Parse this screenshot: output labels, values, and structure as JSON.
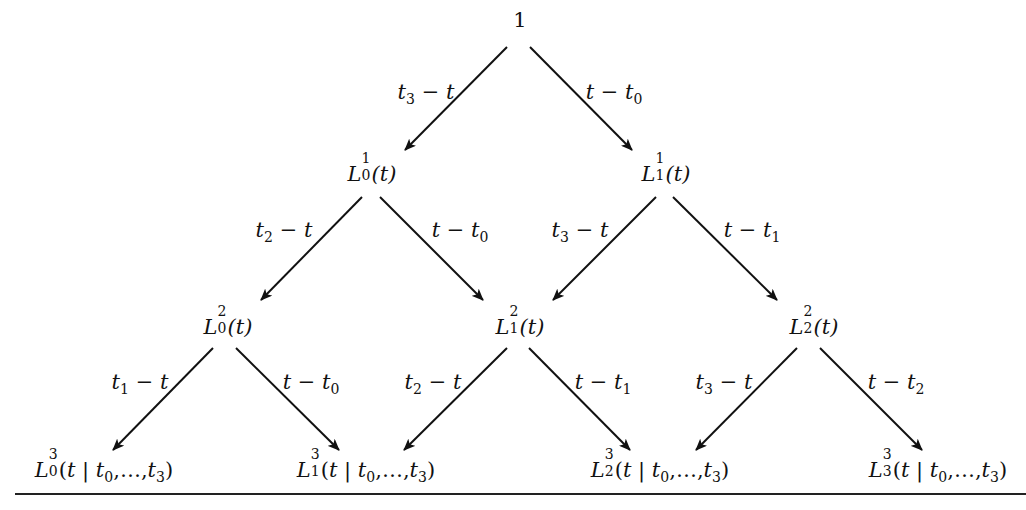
{
  "diagram": {
    "type": "tree",
    "root": {
      "id": "root",
      "label": "1",
      "x": 520,
      "y": 20
    },
    "nodes": [
      {
        "id": "L1_0",
        "base": "L",
        "sup": "1",
        "sub": "0",
        "arg": "(t)",
        "x": 372,
        "y": 172
      },
      {
        "id": "L1_1",
        "base": "L",
        "sup": "1",
        "sub": "1",
        "arg": "(t)",
        "x": 666,
        "y": 172
      },
      {
        "id": "L2_0",
        "base": "L",
        "sup": "2",
        "sub": "0",
        "arg": "(t)",
        "x": 228,
        "y": 325
      },
      {
        "id": "L2_1",
        "base": "L",
        "sup": "2",
        "sub": "1",
        "arg": "(t)",
        "x": 520,
        "y": 325
      },
      {
        "id": "L2_2",
        "base": "L",
        "sup": "2",
        "sub": "2",
        "arg": "(t)",
        "x": 814,
        "y": 325
      },
      {
        "id": "L3_0",
        "base": "L",
        "sup": "3",
        "sub": "0",
        "arg": "(t | t0,…,t3)",
        "x": 104,
        "y": 470
      },
      {
        "id": "L3_1",
        "base": "L",
        "sup": "3",
        "sub": "1",
        "arg": "(t | t0,…,t3)",
        "x": 366,
        "y": 470
      },
      {
        "id": "L3_2",
        "base": "L",
        "sup": "3",
        "sub": "2",
        "arg": "(t | t0,…,t3)",
        "x": 660,
        "y": 470
      },
      {
        "id": "L3_3",
        "base": "L",
        "sup": "3",
        "sub": "3",
        "arg": "(t | t0,…,t3)",
        "x": 938,
        "y": 470
      }
    ],
    "edges": [
      {
        "from": "root",
        "to": "L1_0",
        "label": "t3 − t",
        "x1": 507,
        "y1": 47,
        "x2": 405,
        "y2": 150,
        "lx": 426,
        "ly": 92
      },
      {
        "from": "root",
        "to": "L1_1",
        "label": "t − t0",
        "x1": 530,
        "y1": 47,
        "x2": 632,
        "y2": 150,
        "lx": 612,
        "ly": 92
      },
      {
        "from": "L1_0",
        "to": "L2_0",
        "label": "t2 − t",
        "x1": 362,
        "y1": 197,
        "x2": 261,
        "y2": 300,
        "lx": 284,
        "ly": 231
      },
      {
        "from": "L1_0",
        "to": "L2_1",
        "label": "t − t0",
        "x1": 380,
        "y1": 197,
        "x2": 483,
        "y2": 300,
        "lx": 460,
        "ly": 231
      },
      {
        "from": "L1_1",
        "to": "L2_1",
        "label": "t3 − t",
        "x1": 656,
        "y1": 197,
        "x2": 553,
        "y2": 300,
        "lx": 580,
        "ly": 231
      },
      {
        "from": "L1_1",
        "to": "L2_2",
        "label": "t − t1",
        "x1": 673,
        "y1": 197,
        "x2": 777,
        "y2": 300,
        "lx": 752,
        "ly": 231
      },
      {
        "from": "L2_0",
        "to": "L3_0",
        "label": "t1 − t",
        "x1": 213,
        "y1": 348,
        "x2": 113,
        "y2": 450,
        "lx": 140,
        "ly": 383
      },
      {
        "from": "L2_0",
        "to": "L3_1",
        "label": "t − t0",
        "x1": 236,
        "y1": 348,
        "x2": 339,
        "y2": 450,
        "lx": 311,
        "ly": 383
      },
      {
        "from": "L2_1",
        "to": "L3_1",
        "label": "t2 − t",
        "x1": 507,
        "y1": 348,
        "x2": 404,
        "y2": 450,
        "lx": 433,
        "ly": 383
      },
      {
        "from": "L2_1",
        "to": "L3_2",
        "label": "t − t1",
        "x1": 529,
        "y1": 348,
        "x2": 630,
        "y2": 450,
        "lx": 603,
        "ly": 383
      },
      {
        "from": "L2_2",
        "to": "L3_2",
        "label": "t3 − t",
        "x1": 797,
        "y1": 348,
        "x2": 696,
        "y2": 450,
        "lx": 724,
        "ly": 383
      },
      {
        "from": "L2_2",
        "to": "L3_3",
        "label": "t − t2",
        "x1": 820,
        "y1": 348,
        "x2": 922,
        "y2": 450,
        "lx": 896,
        "ly": 383
      }
    ],
    "colors": {
      "ink": "#111111",
      "background": "#ffffff"
    }
  },
  "labels": {
    "root": "1",
    "L1_0": {
      "base": "L",
      "sup": "1",
      "sub": "0",
      "arg": "(t)"
    },
    "L1_1": {
      "base": "L",
      "sup": "1",
      "sub": "1",
      "arg": "(t)"
    },
    "L2_0": {
      "base": "L",
      "sup": "2",
      "sub": "0",
      "arg": "(t)"
    },
    "L2_1": {
      "base": "L",
      "sup": "2",
      "sub": "1",
      "arg": "(t)"
    },
    "L2_2": {
      "base": "L",
      "sup": "2",
      "sub": "2",
      "arg": "(t)"
    },
    "L3_0": {
      "base": "L",
      "sup": "3",
      "sub": "0"
    },
    "L3_1": {
      "base": "L",
      "sup": "3",
      "sub": "1"
    },
    "L3_2": {
      "base": "L",
      "sup": "3",
      "sub": "2"
    },
    "L3_3": {
      "base": "L",
      "sup": "3",
      "sub": "3"
    },
    "cond": {
      "open": "(",
      "t": "t",
      "bar": " | ",
      "t0": "t",
      "s0": "0",
      "sep": ",…,",
      "t3": "t",
      "s3": "3",
      "close": ")"
    },
    "e": {
      "a": {
        "t": "t",
        "s": "3",
        "rest": " − t"
      },
      "b": {
        "t": "t − t",
        "s": "0"
      },
      "c": {
        "t": "t",
        "s": "2",
        "rest": " − t"
      },
      "d": {
        "t": "t − t",
        "s": "0"
      },
      "e": {
        "t": "t",
        "s": "3",
        "rest": " − t"
      },
      "f": {
        "t": "t − t",
        "s": "1"
      },
      "g": {
        "t": "t",
        "s": "1",
        "rest": " − t"
      },
      "h": {
        "t": "t − t",
        "s": "0"
      },
      "i": {
        "t": "t",
        "s": "2",
        "rest": " − t"
      },
      "j": {
        "t": "t − t",
        "s": "1"
      },
      "k": {
        "t": "t",
        "s": "3",
        "rest": " − t"
      },
      "l": {
        "t": "t − t",
        "s": "2"
      }
    }
  }
}
